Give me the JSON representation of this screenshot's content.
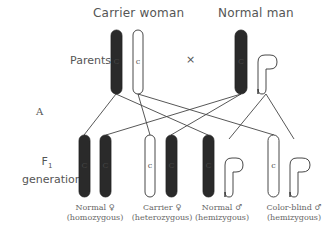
{
  "diagram": {
    "panel_label": "A",
    "row_labels": {
      "parents": "Parents",
      "f1_line1": "F",
      "f1_sub": "1",
      "f1_line2": "generation"
    },
    "parents": {
      "mother": {
        "title": "Carrier woman",
        "chromosomes": [
          {
            "type": "X",
            "allele": "C",
            "fill": "dark"
          },
          {
            "type": "X",
            "allele": "c",
            "fill": "white"
          }
        ]
      },
      "cross_symbol": "×",
      "father": {
        "title": "Normal man",
        "chromosomes": [
          {
            "type": "X",
            "allele": "C",
            "fill": "dark"
          },
          {
            "type": "Y",
            "allele": "",
            "fill": "white"
          }
        ]
      }
    },
    "offspring": [
      {
        "label": "Normal ♀",
        "sublabel": "(homozygous)",
        "alleles": [
          "C",
          "C"
        ]
      },
      {
        "label": "Carrier ♀",
        "sublabel": "(heterozygous)",
        "alleles": [
          "c",
          "C"
        ]
      },
      {
        "label": "Normal ♂",
        "sublabel": "(hemizygous)",
        "alleles": [
          "C",
          "Y"
        ]
      },
      {
        "label": "Color-blind ♂",
        "sublabel": "(hemizygous)",
        "alleles": [
          "c",
          "Y"
        ]
      }
    ],
    "colors": {
      "dark": "#2a2a2a",
      "outline": "#333333",
      "line": "#444444",
      "text": "#555555"
    }
  }
}
